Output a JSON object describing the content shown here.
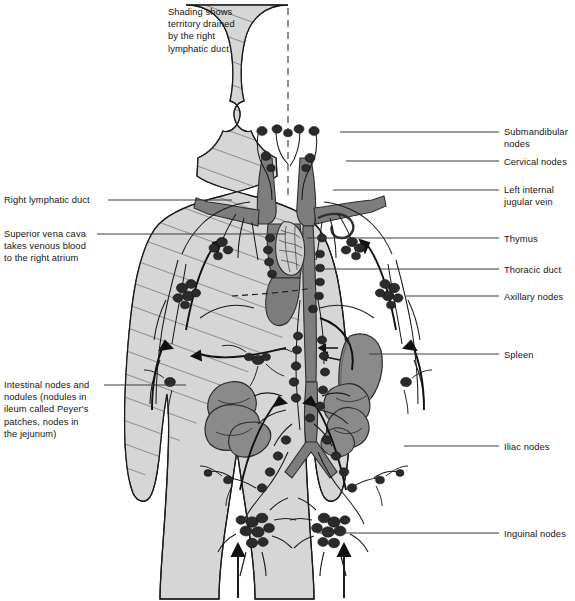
{
  "figure": {
    "type": "anatomical-diagram",
    "colors": {
      "body_fill": "#d6d6d6",
      "body_outline": "#1a1a1a",
      "vessel_fill": "#7d7d7d",
      "organ_fill": "#8a8a8a",
      "node_fill": "#2b2b2b",
      "hatch_line": "#4a4a4a",
      "leader_line": "#3a3a3a",
      "midline_dash": "#555555",
      "background": "#ffffff",
      "text": "#141414"
    }
  },
  "notes": {
    "shading_note": "Shading shows\nterritory drained\nby the right\nlymphatic duct"
  },
  "labels_left": [
    {
      "id": "right-lymphatic-duct",
      "text": "Right lymphatic duct",
      "x": 4,
      "y": 194,
      "leader_x1": 108,
      "leader_y": 200,
      "leader_x2": 232
    },
    {
      "id": "superior-vena-cava",
      "text": "Superior vena cava\ntakes venous blood\nto the right atrium",
      "x": 4,
      "y": 228,
      "leader_x1": 97,
      "leader_y": 234,
      "leader_x2": 286
    },
    {
      "id": "intestinal-nodes",
      "text": "Intestinal nodes and\nnodules (nodules in\nileum called Peyer's\npatches, nodes in\nthe jejunum)",
      "x": 4,
      "y": 379,
      "leader_x1": 104,
      "leader_y": 385,
      "leader_x2": 186
    }
  ],
  "labels_right": [
    {
      "id": "submandibular-nodes",
      "text": "Submandibular\nnodes",
      "x": 504,
      "y": 126,
      "leader_x1": 340,
      "leader_y": 132,
      "leader_x2": 499
    },
    {
      "id": "cervical-nodes",
      "text": "Cervical nodes",
      "x": 504,
      "y": 156,
      "leader_x1": 346,
      "leader_y": 161,
      "leader_x2": 499
    },
    {
      "id": "left-internal-jugular-vein",
      "text": "Left internal\njugular vein",
      "x": 504,
      "y": 184,
      "leader_x1": 333,
      "leader_y": 190,
      "leader_x2": 499
    },
    {
      "id": "thymus",
      "text": "Thymus",
      "x": 504,
      "y": 233,
      "leader_x1": 307,
      "leader_y": 238,
      "leader_x2": 499
    },
    {
      "id": "thoracic-duct",
      "text": "Thoracic duct",
      "x": 504,
      "y": 264,
      "leader_x1": 318,
      "leader_y": 269,
      "leader_x2": 499
    },
    {
      "id": "axillary-nodes",
      "text": "Axillary nodes",
      "x": 504,
      "y": 291,
      "leader_x1": 406,
      "leader_y": 296,
      "leader_x2": 499
    },
    {
      "id": "spleen",
      "text": "Spleen",
      "x": 504,
      "y": 349,
      "leader_x1": 369,
      "leader_y": 354,
      "leader_x2": 499
    },
    {
      "id": "iliac-nodes",
      "text": "Iliac nodes",
      "x": 504,
      "y": 441,
      "leader_x1": 404,
      "leader_y": 446,
      "leader_x2": 499
    },
    {
      "id": "inguinal-nodes",
      "text": "Inguinal nodes",
      "x": 504,
      "y": 528,
      "leader_x1": 317,
      "leader_y": 533,
      "leader_x2": 499
    }
  ]
}
